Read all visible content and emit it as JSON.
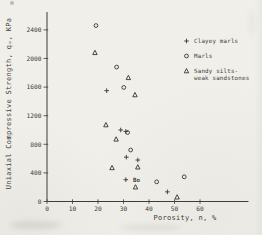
{
  "figure": {
    "background": "#f0efea",
    "ink": "#3c3b36"
  },
  "chart_data": {
    "type": "scatter",
    "title": "",
    "xlabel": "Porosity, n, %",
    "ylabel": "Uniaxial Compressive Strength, qᵤ, KPa",
    "xlim": [
      0,
      79
    ],
    "ylim": [
      0,
      2650
    ],
    "x_ticks": [
      0,
      10,
      20,
      30,
      40,
      50,
      60
    ],
    "y_ticks": [
      0,
      400,
      800,
      1200,
      1600,
      2000,
      2400
    ],
    "grid": false,
    "legend_position": "upper right",
    "series": [
      {
        "name": "Clayey marls",
        "marker": "plus",
        "points": [
          [
            23.4,
            1550
          ],
          [
            28.9,
            1000
          ],
          [
            30.9,
            980
          ],
          [
            31.1,
            620
          ],
          [
            35.6,
            580
          ],
          [
            30.9,
            305
          ],
          [
            47.2,
            135
          ]
        ]
      },
      {
        "name": "Marls",
        "marker": "circle",
        "points": [
          [
            19.2,
            2460
          ],
          [
            27.3,
            1880
          ],
          [
            30.1,
            1595
          ],
          [
            31.6,
            965
          ],
          [
            32.8,
            720
          ],
          [
            43.0,
            275
          ],
          [
            53.8,
            345
          ]
        ]
      },
      {
        "name": "Sandy silts-weak sandstones",
        "marker": "triangle",
        "points": [
          [
            18.8,
            2080
          ],
          [
            31.9,
            1730
          ],
          [
            34.5,
            1490
          ],
          [
            23.1,
            1070
          ],
          [
            27.1,
            870
          ],
          [
            25.5,
            470
          ],
          [
            35.6,
            480
          ],
          [
            34.7,
            200
          ],
          [
            51.0,
            60
          ]
        ]
      }
    ],
    "annotations": [
      {
        "text": "Bo",
        "x": 35.1,
        "y": 300
      }
    ]
  }
}
